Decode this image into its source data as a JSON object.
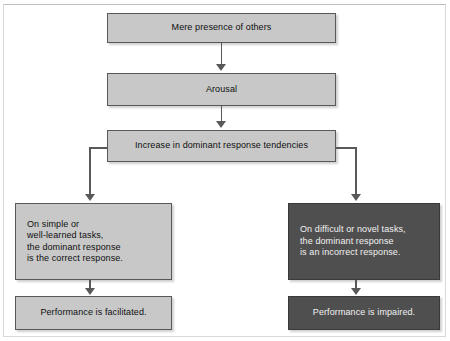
{
  "figure": {
    "type": "flowchart",
    "colors": {
      "light_box_fill": "#c8c8c8",
      "dark_box_fill": "#4f4f4f",
      "box_border": "#5c5c5c",
      "connector": "#595959",
      "light_box_text": "#0f0f0f",
      "dark_box_text": "#f2f2f2",
      "background": "#ffffff"
    }
  },
  "nodes": {
    "mere_presence": "Mere presence of others",
    "arousal": "Arousal",
    "increase_dominant": "Increase in dominant response tendencies",
    "left_condition": "On simple or\nwell-learned tasks,\nthe dominant response\nis the correct response.",
    "left_outcome": "Performance is facilitated.",
    "right_condition": "On difficult or novel tasks,\nthe dominant response\nis an incorrect response.",
    "right_outcome": "Performance is impaired."
  }
}
